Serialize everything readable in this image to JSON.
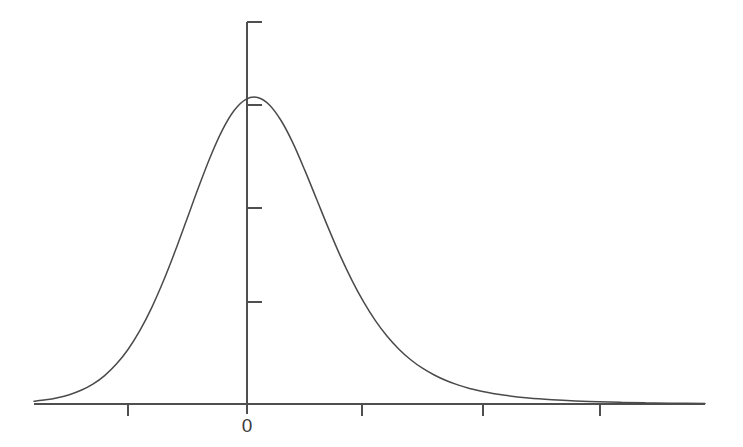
{
  "chart_data": {
    "type": "line",
    "title": "",
    "subtitle": "",
    "xlabel": "",
    "ylabel": "",
    "grid": false,
    "legend": null,
    "xlim": [
      -1.8,
      3.9
    ],
    "ylim": [
      0,
      0.41
    ],
    "x_tick_labels": [
      "",
      "0",
      "",
      "",
      ""
    ],
    "x_tick_values": [
      -1.0,
      0.0,
      1.0,
      2.0,
      2.7
    ],
    "y_tick_labels": [
      "",
      "",
      "",
      ""
    ],
    "y_tick_values": [
      0.1,
      0.2,
      0.3,
      0.4
    ],
    "series": [
      {
        "name": "density",
        "x": [
          -1.8,
          -1.7,
          -1.6,
          -1.5,
          -1.4,
          -1.3,
          -1.2,
          -1.1,
          -1.0,
          -0.9,
          -0.8,
          -0.7,
          -0.6,
          -0.5,
          -0.4,
          -0.3,
          -0.2,
          -0.1,
          0.0,
          0.1,
          0.2,
          0.3,
          0.4,
          0.5,
          0.6,
          0.7,
          0.8,
          0.9,
          1.0,
          1.1,
          1.2,
          1.3,
          1.4,
          1.5,
          1.6,
          1.7,
          1.8,
          1.9,
          2.0,
          2.2,
          2.4,
          2.6,
          2.8,
          3.0,
          3.2,
          3.4,
          3.6,
          3.9
        ],
        "y": [
          0.003,
          0.0045,
          0.0068,
          0.01,
          0.0147,
          0.0213,
          0.0305,
          0.0428,
          0.0588,
          0.079,
          0.1035,
          0.1322,
          0.1644,
          0.1988,
          0.2334,
          0.266,
          0.294,
          0.315,
          0.327,
          0.329,
          0.321,
          0.304,
          0.28,
          0.251,
          0.22,
          0.189,
          0.1595,
          0.133,
          0.1095,
          0.0895,
          0.0727,
          0.0588,
          0.0475,
          0.0384,
          0.0311,
          0.0252,
          0.0205,
          0.0167,
          0.0137,
          0.0093,
          0.0064,
          0.0045,
          0.0032,
          0.0023,
          0.0017,
          0.0012,
          0.0009,
          0.0006
        ]
      }
    ]
  },
  "axes": {
    "x_axis_name": "horizontal-value-axis",
    "y_axis_name": "vertical-density-axis",
    "origin_label": "0"
  },
  "colors": {
    "background": "#ffffff",
    "curve": "#4a4a4a",
    "axis": "#4f4f4f",
    "label": "#3b3b3b"
  }
}
